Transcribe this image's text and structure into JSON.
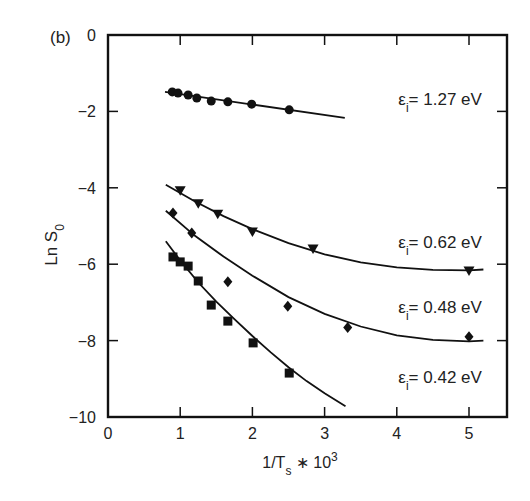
{
  "chart_data": {
    "type": "scatter",
    "panel_label": "(b)",
    "title": "",
    "xlabel": "1/T_s * 10^3",
    "ylabel": "Ln S_0",
    "xlim": [
      0,
      5.5
    ],
    "ylim": [
      -10,
      0
    ],
    "xticks": [
      0,
      1,
      2,
      3,
      4,
      5
    ],
    "yticks": [
      0,
      -2,
      -4,
      -6,
      -8,
      -10
    ],
    "grid": false,
    "legend": "inline labels",
    "series": [
      {
        "name": "εi = 1.27 eV",
        "label_sub": "i",
        "label_value": "= 1.27 eV",
        "marker": "circle",
        "x": [
          0.89,
          0.97,
          1.11,
          1.23,
          1.43,
          1.66,
          1.99,
          2.51
        ],
        "y": [
          -1.49,
          -1.52,
          -1.57,
          -1.65,
          -1.73,
          -1.75,
          -1.81,
          -1.96
        ],
        "fit": {
          "x": [
            0.79,
            3.28
          ],
          "y": [
            -1.49,
            -2.17
          ]
        },
        "label_pos": [
          4.6,
          -1.84
        ]
      },
      {
        "name": "εi = 0.62 eV",
        "label_sub": "i",
        "label_value": "= 0.62 eV",
        "marker": "triangle-down",
        "x": [
          1.0,
          1.25,
          1.52,
          2.0,
          2.84,
          5.0
        ],
        "y": [
          -4.08,
          -4.42,
          -4.69,
          -5.16,
          -5.6,
          -6.18
        ],
        "fit": {
          "x": [
            0.8,
            1.2,
            1.6,
            2.0,
            2.5,
            3.0,
            3.5,
            4.0,
            4.5,
            5.0,
            5.2
          ],
          "y": [
            -3.92,
            -4.35,
            -4.74,
            -5.08,
            -5.45,
            -5.74,
            -5.95,
            -6.08,
            -6.15,
            -6.16,
            -6.14
          ]
        },
        "label_pos": [
          4.6,
          -5.58
        ]
      },
      {
        "name": "εi = 0.48 eV",
        "label_sub": "i",
        "label_value": "= 0.48 eV",
        "marker": "diamond",
        "x": [
          0.9,
          1.16,
          1.66,
          2.49,
          3.32,
          5.0
        ],
        "y": [
          -4.66,
          -5.18,
          -6.46,
          -7.1,
          -7.66,
          -7.9
        ],
        "fit": {
          "x": [
            0.8,
            1.2,
            1.6,
            2.0,
            2.5,
            3.0,
            3.5,
            4.0,
            4.5,
            5.0,
            5.2
          ],
          "y": [
            -4.6,
            -5.25,
            -5.8,
            -6.3,
            -6.86,
            -7.3,
            -7.63,
            -7.86,
            -7.98,
            -8.02,
            -8.0
          ]
        },
        "label_pos": [
          4.6,
          -7.28
        ]
      },
      {
        "name": "εi = 0.42 eV",
        "label_sub": "i",
        "label_value": "= 0.42 eV",
        "marker": "square",
        "x": [
          0.9,
          1.0,
          1.11,
          1.25,
          1.43,
          1.66,
          2.01,
          2.51
        ],
        "y": [
          -5.81,
          -5.94,
          -6.05,
          -6.44,
          -7.07,
          -7.49,
          -8.06,
          -8.85
        ],
        "fit": {
          "x": [
            0.8,
            1.0,
            1.25,
            1.5,
            1.75,
            2.0,
            2.25,
            2.5,
            2.75,
            3.0,
            3.29
          ],
          "y": [
            -5.4,
            -5.9,
            -6.48,
            -6.98,
            -7.44,
            -7.88,
            -8.3,
            -8.7,
            -9.06,
            -9.38,
            -9.72
          ]
        },
        "label_pos": [
          4.6,
          -9.1
        ]
      }
    ]
  }
}
